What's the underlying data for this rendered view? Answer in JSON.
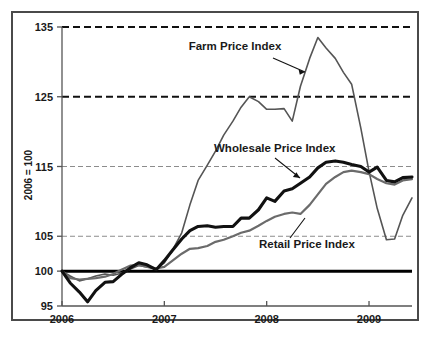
{
  "chart_data": {
    "type": "line",
    "title": "",
    "xlabel": "",
    "ylabel": "2006 = 100",
    "ylim": [
      95,
      135
    ],
    "xlim": [
      2006.0,
      2009.42
    ],
    "yticks": [
      95,
      100,
      105,
      115,
      125,
      135
    ],
    "ytick_labels": [
      "95",
      "100",
      "105",
      "115",
      "125",
      "135"
    ],
    "xticks": [
      2006,
      2007,
      2008,
      2009
    ],
    "xtick_labels": [
      "2006",
      "2007",
      "2008",
      "2009"
    ],
    "grid": "horizontal dashed gridlines at 105, 115 (light gray) and 125, 135 (bold black); solid black baseline at 100",
    "legend_position": "inline annotations with leader lines",
    "baseline_value": 100,
    "series": [
      {
        "name": "Farm Price Index",
        "color": "#555555",
        "style": "thin gray line",
        "x": [
          2006.0,
          2006.08,
          2006.17,
          2006.25,
          2006.33,
          2006.42,
          2006.5,
          2006.58,
          2006.67,
          2006.75,
          2006.83,
          2006.92,
          2007.0,
          2007.08,
          2007.17,
          2007.25,
          2007.33,
          2007.42,
          2007.5,
          2007.58,
          2007.67,
          2007.75,
          2007.83,
          2007.92,
          2008.0,
          2008.08,
          2008.17,
          2008.25,
          2008.33,
          2008.42,
          2008.5,
          2008.58,
          2008.67,
          2008.75,
          2008.83,
          2008.92,
          2009.0,
          2009.08,
          2009.17,
          2009.25,
          2009.33,
          2009.42
        ],
        "y": [
          100.0,
          99.3,
          98.6,
          98.9,
          99.3,
          99.6,
          99.4,
          99.7,
          100.3,
          100.8,
          100.6,
          100.3,
          101.2,
          103.0,
          105.5,
          109.5,
          113.0,
          115.2,
          117.2,
          119.5,
          121.5,
          123.5,
          125.0,
          124.3,
          123.2,
          123.2,
          123.3,
          121.5,
          126.5,
          130.5,
          133.5,
          132.0,
          130.5,
          128.5,
          126.8,
          120.5,
          114.3,
          109.0,
          104.5,
          104.6,
          108.0,
          110.5
        ]
      },
      {
        "name": "Wholesale Price Index",
        "color": "#111111",
        "style": "thick black line",
        "x": [
          2006.0,
          2006.08,
          2006.17,
          2006.25,
          2006.33,
          2006.42,
          2006.5,
          2006.58,
          2006.67,
          2006.75,
          2006.83,
          2006.92,
          2007.0,
          2007.08,
          2007.17,
          2007.25,
          2007.33,
          2007.42,
          2007.5,
          2007.58,
          2007.67,
          2007.75,
          2007.83,
          2007.92,
          2008.0,
          2008.08,
          2008.17,
          2008.25,
          2008.33,
          2008.42,
          2008.5,
          2008.58,
          2008.67,
          2008.75,
          2008.83,
          2008.92,
          2009.0,
          2009.08,
          2009.17,
          2009.25,
          2009.33,
          2009.42
        ],
        "y": [
          100.0,
          98.3,
          97.0,
          95.6,
          97.2,
          98.4,
          98.5,
          99.5,
          100.5,
          101.2,
          100.9,
          100.2,
          101.5,
          103.0,
          104.6,
          105.8,
          106.4,
          106.5,
          106.3,
          106.4,
          106.4,
          107.6,
          107.6,
          108.8,
          110.5,
          110.0,
          111.5,
          111.8,
          112.6,
          113.5,
          114.8,
          115.6,
          115.8,
          115.6,
          115.3,
          115.0,
          114.2,
          114.9,
          113.0,
          112.8,
          113.4,
          113.5
        ]
      },
      {
        "name": "Retail Price Index",
        "color": "#6b6b6b",
        "style": "medium gray line",
        "x": [
          2006.0,
          2006.08,
          2006.17,
          2006.25,
          2006.33,
          2006.42,
          2006.5,
          2006.58,
          2006.67,
          2006.75,
          2006.83,
          2006.92,
          2007.0,
          2007.08,
          2007.17,
          2007.25,
          2007.33,
          2007.42,
          2007.5,
          2007.58,
          2007.67,
          2007.75,
          2007.83,
          2007.92,
          2008.0,
          2008.08,
          2008.17,
          2008.25,
          2008.33,
          2008.42,
          2008.5,
          2008.58,
          2008.67,
          2008.75,
          2008.83,
          2008.92,
          2009.0,
          2009.08,
          2009.17,
          2009.25,
          2009.33,
          2009.42
        ],
        "y": [
          100.0,
          99.0,
          98.8,
          98.9,
          99.0,
          99.2,
          99.6,
          100.2,
          100.8,
          100.9,
          100.6,
          100.4,
          100.6,
          101.5,
          102.5,
          103.2,
          103.3,
          103.6,
          104.2,
          104.5,
          105.0,
          105.5,
          105.8,
          106.5,
          107.2,
          107.8,
          108.2,
          108.4,
          108.2,
          109.5,
          111.0,
          112.5,
          113.5,
          114.2,
          114.4,
          114.2,
          113.9,
          113.2,
          112.6,
          112.4,
          113.0,
          113.2
        ]
      }
    ],
    "annotations": [
      {
        "text": "Farm Price Index",
        "x": 235,
        "y": 50
      },
      {
        "text": "Wholesale Price Index",
        "x": 214,
        "y": 152
      },
      {
        "text": "Retail Price Index",
        "x": 259,
        "y": 248
      }
    ]
  },
  "axis": {
    "ylabel": "2006 = 100",
    "ytick_labels": [
      "135",
      "125",
      "115",
      "105",
      "100",
      "95"
    ],
    "xtick_labels": [
      "2006",
      "2007",
      "2008",
      "2009"
    ]
  },
  "labels": {
    "farm": "Farm Price Index",
    "wholesale": "Wholesale Price Index",
    "retail": "Retail Price Index"
  }
}
